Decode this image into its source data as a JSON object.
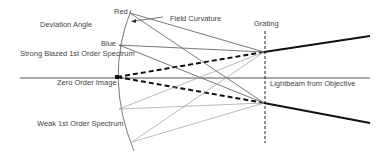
{
  "diagram": {
    "labels": {
      "red": "Red",
      "field_curvature": "Field Curvature",
      "deviation_angle": "Deviation Angle",
      "blue": "Blue",
      "strong_blazed": "Strong Blazed 1st Order Spectrum",
      "grating": "Grating",
      "zero_order_image": "Zero Order Image",
      "lightbeam": "Lightbeam from Objective",
      "weak_order": "Weak 1st Order Spectrum"
    },
    "colors": {
      "thick_line": "#111111",
      "thin_line": "#555555",
      "faint_line": "#999999",
      "text": "#444444",
      "background": "#ffffff"
    }
  }
}
